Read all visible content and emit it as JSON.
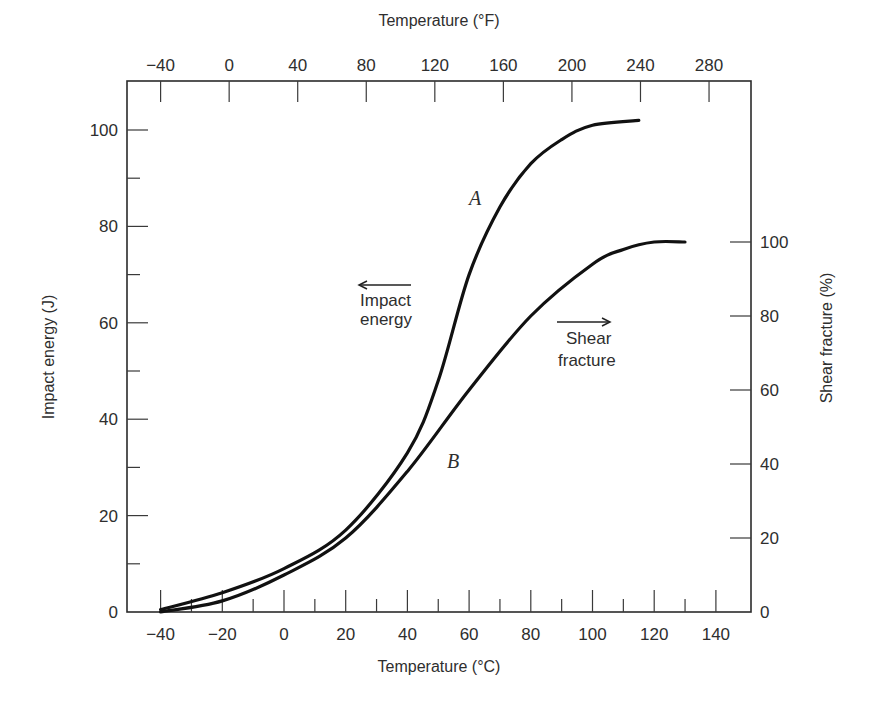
{
  "chart_data": {
    "type": "line",
    "title": "",
    "xlabel": "Temperature (°C)",
    "x2label": "Temperature (°F)",
    "ylabel": "Impact energy (J)",
    "y2label": "Shear fracture (%)",
    "xlim": [
      -50,
      150
    ],
    "ylim": [
      0,
      110
    ],
    "y2lim": [
      0,
      165
    ],
    "grid": false,
    "legend": "none",
    "x_ticks": [
      -40,
      -20,
      0,
      20,
      40,
      60,
      80,
      100,
      120,
      140
    ],
    "x_tick_labels": [
      "−40",
      "−20",
      "0",
      "20",
      "40",
      "60",
      "80",
      "100",
      "120",
      "140"
    ],
    "x_minor_ticks": [
      -30,
      -10,
      10,
      30,
      50,
      70,
      90,
      110,
      130
    ],
    "x2_ticks_F": [
      -40,
      0,
      40,
      80,
      120,
      160,
      200,
      240,
      280
    ],
    "x2_tick_labels": [
      "−40",
      "0",
      "40",
      "80",
      "120",
      "160",
      "200",
      "240",
      "280"
    ],
    "y_ticks": [
      0,
      20,
      40,
      60,
      80,
      100
    ],
    "y_minor_ticks": [
      10,
      30,
      50,
      70,
      90
    ],
    "y2_ticks": [
      0,
      20,
      40,
      60,
      80,
      100
    ],
    "series": [
      {
        "name": "A",
        "description": "Impact energy",
        "axis": "left",
        "x": [
          -40,
          -20,
          0,
          20,
          40,
          50,
          60,
          70,
          80,
          90,
          100,
          115
        ],
        "values": [
          0.5,
          4,
          9,
          17,
          33,
          48,
          70,
          84,
          93,
          98,
          101,
          102
        ]
      },
      {
        "name": "B",
        "description": "Shear fracture",
        "axis": "right",
        "x": [
          -40,
          -20,
          0,
          20,
          40,
          60,
          80,
          100,
          110,
          120,
          130
        ],
        "values": [
          0,
          3,
          10,
          20,
          38,
          60,
          80,
          94,
          98,
          100,
          100
        ]
      }
    ],
    "annotations": [
      {
        "text": "Impact energy",
        "arrow": "left",
        "x": 45,
        "y": 62
      },
      {
        "text": "Shear fracture",
        "arrow": "right",
        "x": 103,
        "y": 58
      },
      {
        "text": "A",
        "x": 64,
        "y": 78
      },
      {
        "text": "B",
        "x": 58,
        "y": 38
      }
    ]
  },
  "labels": {
    "x_axis_title": "Temperature (°C)",
    "top_axis_title": "Temperature (°F)",
    "left_axis_title": "Impact energy (J)",
    "right_axis_title": "Shear fracture (%)",
    "annot_impact_1": "Impact",
    "annot_impact_2": "energy",
    "annot_shear_1": "Shear",
    "annot_shear_2": "fracture",
    "curve_a": "A",
    "curve_b": "B"
  }
}
